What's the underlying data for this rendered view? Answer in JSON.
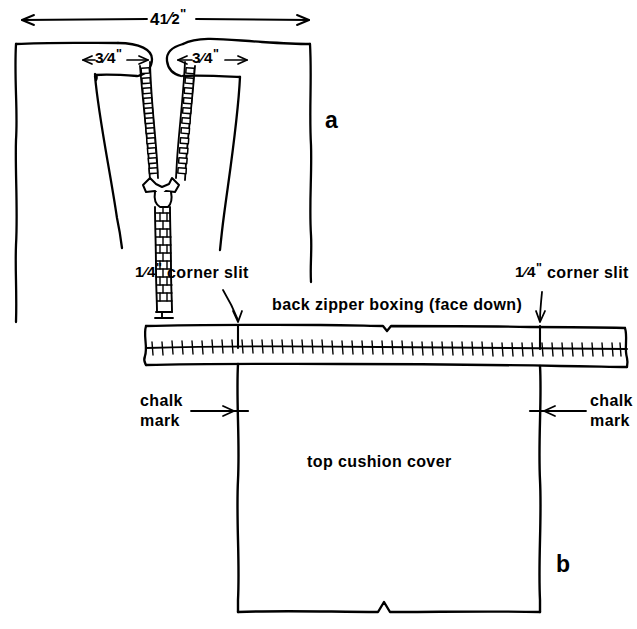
{
  "figure": {
    "title_implicit": "zipper boxing construction diagram",
    "panels": [
      {
        "key": "a",
        "label": "a",
        "label_pos": {
          "x": 325,
          "y": 108
        },
        "dimensions": [
          {
            "name": "overall-width",
            "value": "4 1/2\"",
            "whole": "4",
            "numerator": "1",
            "denominator": "2",
            "unit": "\""
          },
          {
            "name": "left-slit-width",
            "value": "3/4\"",
            "numerator": "3",
            "denominator": "4",
            "unit": "\""
          },
          {
            "name": "right-slit-width",
            "value": "3/4\"",
            "numerator": "3",
            "denominator": "4",
            "unit": "\""
          }
        ]
      },
      {
        "key": "b",
        "label": "b",
        "label_pos": {
          "x": 556,
          "y": 552
        },
        "annotations": [
          {
            "name": "corner-slit-left",
            "text": "1/4\" corner slit",
            "numerator": "1",
            "denominator": "4",
            "suffix": " corner slit"
          },
          {
            "name": "corner-slit-right",
            "text": "1/4\" corner slit",
            "numerator": "1",
            "denominator": "4",
            "suffix": " corner slit"
          },
          {
            "name": "boxing-label",
            "text": "back zipper boxing (face down)"
          },
          {
            "name": "chalk-mark-left",
            "line1": "chalk",
            "line2": "mark"
          },
          {
            "name": "chalk-mark-right",
            "line1": "chalk",
            "line2": "mark"
          },
          {
            "name": "cushion-label",
            "text": "top cushion cover"
          }
        ]
      }
    ],
    "colors": {
      "ink": "#000000",
      "paper": "#ffffff"
    }
  },
  "labels": {
    "dim_overall_whole": "4",
    "dim_overall_num": "1",
    "dim_overall_den": "2",
    "quote": "\"",
    "slit_left_num": "3",
    "slit_left_den": "4",
    "slit_right_num": "3",
    "slit_right_den": "4",
    "corner_slit_num": "1",
    "corner_slit_den": "4",
    "corner_slit_suffix": " corner slit",
    "boxing": "back zipper boxing (face down)",
    "chalk_line1": "chalk",
    "chalk_line2": "mark",
    "cushion": "top cushion cover",
    "fig_a": "a",
    "fig_b": "b"
  }
}
